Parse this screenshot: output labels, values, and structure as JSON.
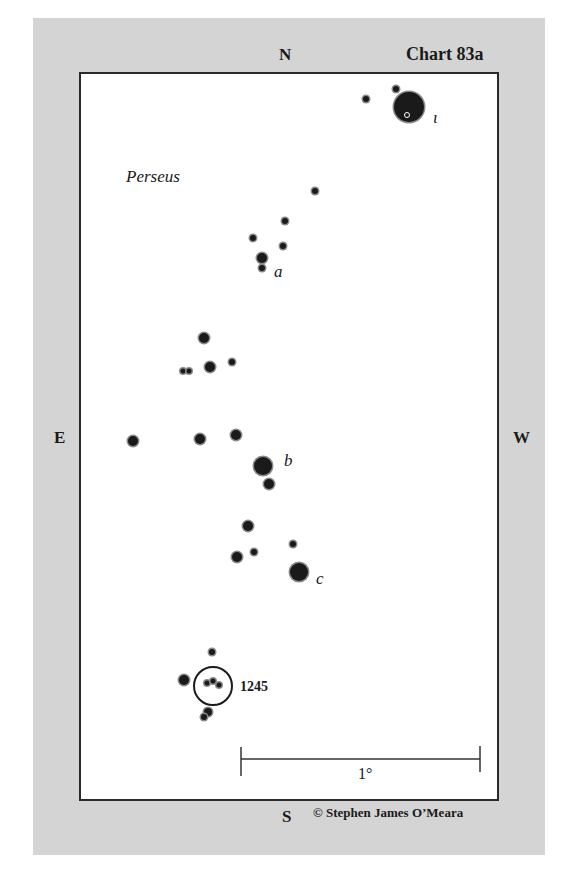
{
  "chart": {
    "title": "Chart 83a",
    "constellation": "Perseus",
    "copyright": "© Stephen James O’Meara",
    "compass": {
      "north": "N",
      "south": "S",
      "east": "E",
      "west": "W"
    },
    "scale_bar": {
      "label": "1°",
      "x1": 241,
      "x2": 480,
      "y": 759
    },
    "object": {
      "label": "1245",
      "circle": {
        "cx": 213,
        "cy": 686,
        "r": 19
      }
    },
    "star_labels": [
      {
        "text": "ι",
        "x": 433,
        "y": 123
      },
      {
        "text": "a",
        "x": 274,
        "y": 277
      },
      {
        "text": "b",
        "x": 284,
        "y": 466
      },
      {
        "text": "c",
        "x": 316,
        "y": 584
      }
    ],
    "stars": [
      {
        "x": 409,
        "y": 107,
        "r": 15
      },
      {
        "x": 396,
        "y": 89,
        "r": 3
      },
      {
        "x": 366,
        "y": 99,
        "r": 3
      },
      {
        "x": 315,
        "y": 191,
        "r": 3
      },
      {
        "x": 285,
        "y": 221,
        "r": 3
      },
      {
        "x": 253,
        "y": 238,
        "r": 3
      },
      {
        "x": 283,
        "y": 246,
        "r": 3
      },
      {
        "x": 262,
        "y": 258,
        "r": 5
      },
      {
        "x": 262,
        "y": 268,
        "r": 3
      },
      {
        "x": 204,
        "y": 338,
        "r": 5
      },
      {
        "x": 210,
        "y": 367,
        "r": 5
      },
      {
        "x": 232,
        "y": 362,
        "r": 3
      },
      {
        "x": 183,
        "y": 371,
        "r": 2.5
      },
      {
        "x": 189,
        "y": 371,
        "r": 2.5
      },
      {
        "x": 133,
        "y": 441,
        "r": 5
      },
      {
        "x": 200,
        "y": 439,
        "r": 5
      },
      {
        "x": 236,
        "y": 435,
        "r": 5
      },
      {
        "x": 263,
        "y": 466,
        "r": 9
      },
      {
        "x": 269,
        "y": 484,
        "r": 5
      },
      {
        "x": 248,
        "y": 526,
        "r": 5
      },
      {
        "x": 237,
        "y": 557,
        "r": 5
      },
      {
        "x": 254,
        "y": 552,
        "r": 3
      },
      {
        "x": 293,
        "y": 544,
        "r": 3
      },
      {
        "x": 299,
        "y": 572,
        "r": 9
      },
      {
        "x": 212,
        "y": 652,
        "r": 3
      },
      {
        "x": 184,
        "y": 680,
        "r": 5
      },
      {
        "x": 207,
        "y": 683,
        "r": 2.5
      },
      {
        "x": 213,
        "y": 681,
        "r": 2.5
      },
      {
        "x": 219,
        "y": 685,
        "r": 2.5
      },
      {
        "x": 208,
        "y": 712,
        "r": 4
      },
      {
        "x": 204,
        "y": 717,
        "r": 3
      }
    ],
    "colors": {
      "panel": "#d4d4d4",
      "ink": "#1a1a1a",
      "halo": "#8a8a8a"
    }
  }
}
